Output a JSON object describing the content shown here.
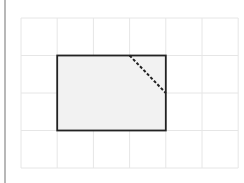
{
  "diagram": {
    "type": "grid-with-rectangle",
    "grid": {
      "columns": 6,
      "rows": 4,
      "origin": [
        21,
        18
      ],
      "cell_width": 36.2,
      "cell_height": 37.5,
      "line_color": "#e6e6e6"
    },
    "rectangle": {
      "from_cell": [
        1,
        1
      ],
      "to_cell": [
        4,
        3
      ],
      "fill": "#f2f2f2",
      "stroke": "#222222"
    },
    "dashed_line": {
      "from_grid_point": [
        3,
        1
      ],
      "to_grid_point": [
        4,
        2
      ],
      "stroke": "#222222",
      "style": "dashed"
    },
    "left_border_color": "#b8b8b8"
  }
}
